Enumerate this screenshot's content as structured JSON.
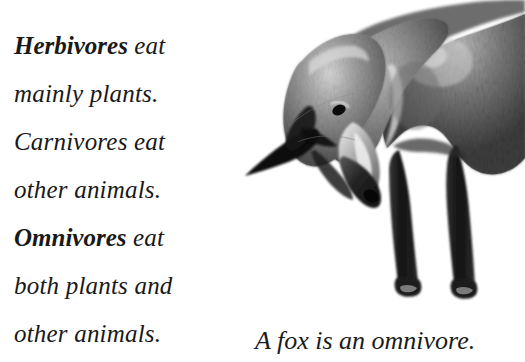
{
  "page": {
    "background_color": "#ffffff",
    "text_color": "#191919"
  },
  "body_text": {
    "lines": [
      {
        "term": "Herbivores",
        "rest": " eat"
      },
      {
        "term": "",
        "rest": "mainly plants."
      },
      {
        "term": "",
        "rest": "Carnivores eat"
      },
      {
        "term": "",
        "rest": "other animals."
      },
      {
        "term": "Omnivores",
        "rest": " eat"
      },
      {
        "term": "",
        "rest": "both plants and"
      },
      {
        "term": "",
        "rest": "other animals."
      }
    ],
    "full_text": "Herbivores eat mainly plants. Carnivores eat other animals. Omnivores eat both plants and other animals.",
    "line1_bold": "Herbivores",
    "line1_rest": " eat",
    "line2": "mainly plants.",
    "line3": "Carnivores eat",
    "line4": "other animals.",
    "line5_bold": "Omnivores",
    "line5_rest": " eat",
    "line6": "both plants and",
    "line7": "other animals."
  },
  "figure": {
    "caption": "A fox is an omnivore.",
    "image_name": "fox-photograph",
    "image_description": "Black and white photograph of a fox with its head lowered",
    "colors": {
      "fur_dark": "#2b2b2b",
      "fur_mid": "#6e6e6e",
      "fur_light": "#c9c9c9",
      "fur_highlight": "#ececec",
      "ear_black": "#0d0d0d",
      "leg_black": "#171717"
    }
  }
}
